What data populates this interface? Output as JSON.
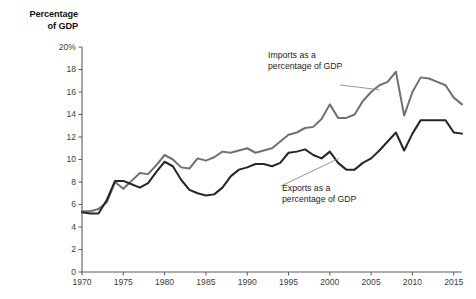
{
  "chart_data": {
    "type": "line",
    "title": "",
    "axis_title": "Percentage\nof GDP",
    "xlabel": "",
    "ylabel": "Percentage of GDP",
    "xlim": [
      1970,
      2016
    ],
    "ylim": [
      0,
      20
    ],
    "grid": false,
    "legend_position": "inline-annotations",
    "yticks": [
      "20%",
      "18",
      "16",
      "14",
      "12",
      "10",
      "8",
      "6",
      "4",
      "2",
      "0"
    ],
    "ytick_values": [
      20,
      18,
      16,
      14,
      12,
      10,
      8,
      6,
      4,
      2,
      0
    ],
    "xticks": [
      "1970",
      "1975",
      "1980",
      "1985",
      "1990",
      "1995",
      "2000",
      "2005",
      "2010",
      "2015"
    ],
    "xtick_values": [
      1970,
      1975,
      1980,
      1985,
      1990,
      1995,
      2000,
      2005,
      2010,
      2015
    ],
    "x": [
      1970,
      1971,
      1972,
      1973,
      1974,
      1975,
      1976,
      1977,
      1978,
      1979,
      1980,
      1981,
      1982,
      1983,
      1984,
      1985,
      1986,
      1987,
      1988,
      1989,
      1990,
      1991,
      1992,
      1993,
      1994,
      1995,
      1996,
      1997,
      1998,
      1999,
      2000,
      2001,
      2002,
      2003,
      2004,
      2005,
      2006,
      2007,
      2008,
      2009,
      2010,
      2011,
      2012,
      2013,
      2014,
      2015,
      2016
    ],
    "series": [
      {
        "name": "Imports as a percentage of GDP",
        "color": "#707070",
        "values": [
          5.4,
          5.4,
          5.6,
          6.2,
          8.0,
          7.4,
          8.1,
          8.8,
          8.7,
          9.5,
          10.4,
          10.0,
          9.3,
          9.2,
          10.1,
          9.9,
          10.2,
          10.7,
          10.6,
          10.8,
          11.0,
          10.6,
          10.8,
          11.0,
          11.6,
          12.2,
          12.4,
          12.8,
          12.9,
          13.6,
          14.9,
          13.7,
          13.7,
          14.0,
          15.2,
          16.0,
          16.6,
          16.9,
          17.8,
          13.9,
          16.0,
          17.3,
          17.2,
          16.9,
          16.6,
          15.5,
          14.9
        ]
      },
      {
        "name": "Exports as a percentage of GDP",
        "color": "#262626",
        "values": [
          5.3,
          5.2,
          5.2,
          6.4,
          8.1,
          8.1,
          7.8,
          7.5,
          7.9,
          8.9,
          9.8,
          9.4,
          8.2,
          7.3,
          7.0,
          6.8,
          6.9,
          7.5,
          8.5,
          9.1,
          9.3,
          9.6,
          9.6,
          9.4,
          9.7,
          10.6,
          10.7,
          10.9,
          10.4,
          10.1,
          10.7,
          9.7,
          9.1,
          9.1,
          9.7,
          10.1,
          10.8,
          11.6,
          12.4,
          10.8,
          12.3,
          13.5,
          13.5,
          13.5,
          13.5,
          12.4,
          12.3
        ]
      }
    ],
    "annotations": [
      {
        "id": "imports",
        "text": "Imports as a\npercentage of GDP",
        "target_year": 2006,
        "target_value": 16.6
      },
      {
        "id": "exports",
        "text": "Exports as a\npercentage of GDP",
        "target_year": 2001,
        "target_value": 9.7
      }
    ]
  }
}
